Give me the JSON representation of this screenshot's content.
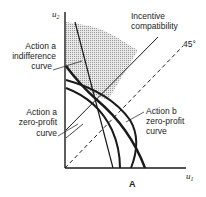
{
  "diagram": {
    "title": "A",
    "axes": {
      "x_label": "u",
      "x_sub": "1",
      "y_label": "u",
      "y_sub": "2"
    },
    "labels": {
      "incentive_line1": "Incentive",
      "incentive_line2": "compatibility",
      "degree45": "45°",
      "indiff_line1": "Action a",
      "indiff_line2": "indifference",
      "indiff_line3": "curve",
      "zpa_line1": "Action a",
      "zpa_line2": "zero-profit",
      "zpa_line3": "curve",
      "zpb_line1": "Action b",
      "zpb_line2": "zero-profit",
      "zpb_line3": "curve"
    },
    "colors": {
      "line": "#1a1a1a",
      "shade": "#c8c8c8"
    }
  }
}
